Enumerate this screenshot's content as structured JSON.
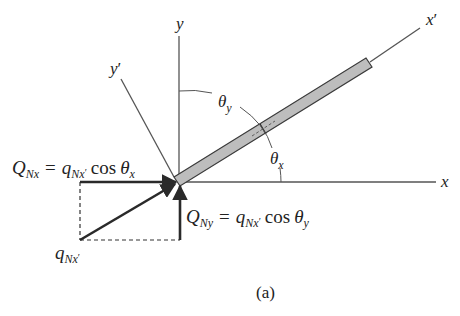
{
  "figure": {
    "caption": "(a)",
    "axes": {
      "x_label": "x",
      "y_label": "y",
      "x_prime_label": "x",
      "x_prime_mark": "′",
      "y_prime_label": "y",
      "y_prime_mark": "′"
    },
    "angles": {
      "theta_y": {
        "symbol": "θ",
        "sub": "y"
      },
      "theta_x": {
        "symbol": "θ",
        "sub": "x"
      }
    },
    "equations": {
      "q_nx": {
        "lhs_symbol": "Q",
        "lhs_sub": "Nx",
        "equals": "=",
        "q_symbol": "q",
        "q_sub": "Nx",
        "q_prime": "′",
        "func": "cos",
        "theta": "θ",
        "theta_sub": "x"
      },
      "q_ny": {
        "lhs_symbol": "Q",
        "lhs_sub": "Ny",
        "equals": "=",
        "q_symbol": "q",
        "q_sub": "Nx",
        "q_prime": "′",
        "func": "cos",
        "theta": "θ",
        "theta_sub": "y"
      }
    },
    "resultant_label": {
      "symbol": "q",
      "sub": "Nx",
      "prime": "′"
    },
    "colors": {
      "line": "#444444",
      "bold_vector": "#2a2a2a",
      "bar_fill": "#bdbdbd",
      "bar_stroke": "#3a3a3a"
    }
  }
}
